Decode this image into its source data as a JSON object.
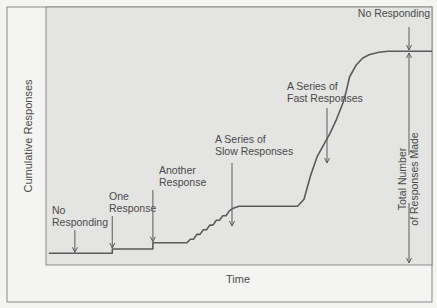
{
  "chart_data": {
    "type": "line",
    "title": "",
    "xlabel": "Time",
    "ylabel": "Cumulative Responses",
    "grid": false,
    "legend": "none",
    "xlim": [
      0,
      100
    ],
    "ylim": [
      0,
      100
    ],
    "series": [
      {
        "name": "cumulative-record",
        "points": [
          [
            1.5,
            5
          ],
          [
            21,
            5
          ],
          [
            21,
            6.8
          ],
          [
            33.5,
            6.8
          ],
          [
            33.5,
            9.5
          ],
          [
            44,
            9.5
          ],
          [
            45,
            11
          ],
          [
            46,
            11
          ],
          [
            47,
            13
          ],
          [
            48,
            13
          ],
          [
            49,
            15
          ],
          [
            50,
            15
          ],
          [
            51,
            17
          ],
          [
            52,
            17
          ],
          [
            53,
            19
          ],
          [
            54,
            19
          ],
          [
            55,
            21
          ],
          [
            56,
            21
          ],
          [
            57,
            23
          ],
          [
            58,
            24
          ],
          [
            60,
            25
          ],
          [
            66,
            25
          ],
          [
            78,
            25
          ],
          [
            80,
            28
          ],
          [
            82,
            38
          ],
          [
            84,
            46
          ],
          [
            86,
            51
          ],
          [
            88,
            56
          ],
          [
            90,
            62
          ],
          [
            92,
            69
          ],
          [
            93,
            74
          ],
          [
            94,
            80
          ],
          [
            96,
            85
          ],
          [
            98,
            88
          ],
          [
            100,
            89.5
          ],
          [
            103,
            90.5
          ],
          [
            106,
            91
          ],
          [
            112,
            91
          ],
          [
            120,
            91
          ]
        ]
      }
    ],
    "annotations": [
      {
        "id": "no-responding-start",
        "lines": [
          "No",
          "Responding"
        ],
        "x": 9.5,
        "y": 5
      },
      {
        "id": "one-response",
        "lines": [
          "One",
          "Response"
        ],
        "x": 21,
        "y": 6.8
      },
      {
        "id": "another-response",
        "lines": [
          "Another",
          "Response"
        ],
        "x": 33.5,
        "y": 9.5
      },
      {
        "id": "slow-responses",
        "lines": [
          "A Series of",
          "Slow Responses"
        ],
        "x": 48,
        "y": 14
      },
      {
        "id": "fast-responses",
        "lines": [
          "A Series of",
          "Fast Responses"
        ],
        "x": 88,
        "y": 55
      },
      {
        "id": "no-responding-end",
        "lines": [
          "No Responding"
        ],
        "x": 106.5,
        "y": 91
      },
      {
        "id": "total-responses",
        "lines": [
          "Total Number",
          "of Responses Made"
        ],
        "x": 106.5,
        "y": 48,
        "orientation": "vertical"
      }
    ]
  }
}
